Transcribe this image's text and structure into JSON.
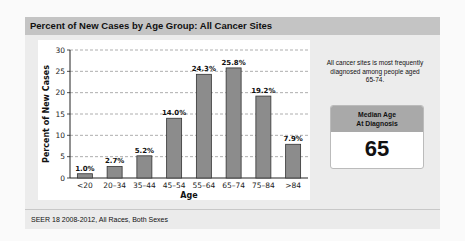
{
  "header": {
    "title": "Percent of New Cases by Age Group: All Cancer Sites"
  },
  "side": {
    "note": "All cancer sites is most frequently diagnosed among people aged 65-74.",
    "median_card": {
      "title_line1": "Median Age",
      "title_line2": "At Diagnosis",
      "value": "65"
    }
  },
  "footer": {
    "text": "SEER 18 2008-2012, All Races, Both Sexes"
  },
  "colors": {
    "bar": "#8c8c8c",
    "bar_border": "#333333",
    "grid": "#999999"
  },
  "chart_data": {
    "type": "bar",
    "title": "Percent of New Cases by Age Group: All Cancer Sites",
    "xlabel": "Age",
    "ylabel": "Percent of New Cases",
    "categories": [
      "<20",
      "20-34",
      "35-44",
      "45-54",
      "55-64",
      "65-74",
      "75-84",
      ">84"
    ],
    "values": [
      1.0,
      2.7,
      5.2,
      14.0,
      24.3,
      25.8,
      19.2,
      7.9
    ],
    "value_labels": [
      "1.0%",
      "2.7%",
      "5.2%",
      "14.0%",
      "24.3%",
      "25.8%",
      "19.2%",
      "7.9%"
    ],
    "yticks": [
      0,
      5,
      10,
      15,
      20,
      25,
      30
    ],
    "ylim": [
      0,
      30
    ],
    "grid": true,
    "legend": "none"
  }
}
